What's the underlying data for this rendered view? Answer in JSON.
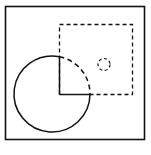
{
  "diagram": {
    "stroke_color": "#111111",
    "background_color": "#ffffff",
    "elements": [
      {
        "name": "outer-frame",
        "shape": "rectangle",
        "line_style": "solid"
      },
      {
        "name": "dashed-rectangle",
        "shape": "rectangle",
        "line_style": "dashed"
      },
      {
        "name": "large-circle-solid-arc",
        "shape": "arc",
        "line_style": "solid"
      },
      {
        "name": "large-circle-dashed-arc",
        "shape": "arc",
        "line_style": "dashed"
      },
      {
        "name": "vertical-line",
        "shape": "line",
        "line_style": "solid"
      },
      {
        "name": "horizontal-line",
        "shape": "line",
        "line_style": "solid"
      },
      {
        "name": "small-dashed-circle",
        "shape": "circle",
        "line_style": "dashed"
      }
    ]
  }
}
